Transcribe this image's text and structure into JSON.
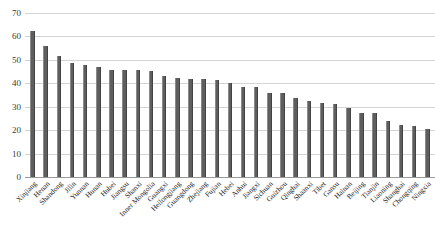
{
  "chart_data": {
    "type": "bar",
    "title": "",
    "xlabel": "",
    "ylabel": "",
    "ylim": [
      0,
      70
    ],
    "yticks": [
      0,
      10,
      20,
      30,
      40,
      50,
      60,
      70
    ],
    "grid": true,
    "legend": "none",
    "orientation": "vertical",
    "bar_color": "#5e5e5e",
    "categories": [
      "Xinjiang",
      "Henan",
      "Shandong",
      "Jilin",
      "Yunnan",
      "Hunan",
      "Hubei",
      "Jiangsu",
      "Shanxi",
      "Inner Mongolia",
      "Guangxi",
      "Heilongjiang",
      "Guangdong",
      "Zhejiang",
      "Fujian",
      "Hebei",
      "Anhui",
      "Jiangxi",
      "Sichuan",
      "Guizhou",
      "Qinghai",
      "Shaanxi",
      "Tibet",
      "Gansu",
      "Hainan",
      "Beijing",
      "Tianjin",
      "Liaoning",
      "Shanghai",
      "Chongqing",
      "Ningxia"
    ],
    "values": [
      62.2,
      55.8,
      51.6,
      48.7,
      47.9,
      46.8,
      45.6,
      45.5,
      45.5,
      45.1,
      43.3,
      42.3,
      41.9,
      41.7,
      41.5,
      40.2,
      38.4,
      38.3,
      36.0,
      35.8,
      33.6,
      32.5,
      31.8,
      31.2,
      29.6,
      27.5,
      27.2,
      24.0,
      22.3,
      21.9,
      20.6
    ]
  }
}
